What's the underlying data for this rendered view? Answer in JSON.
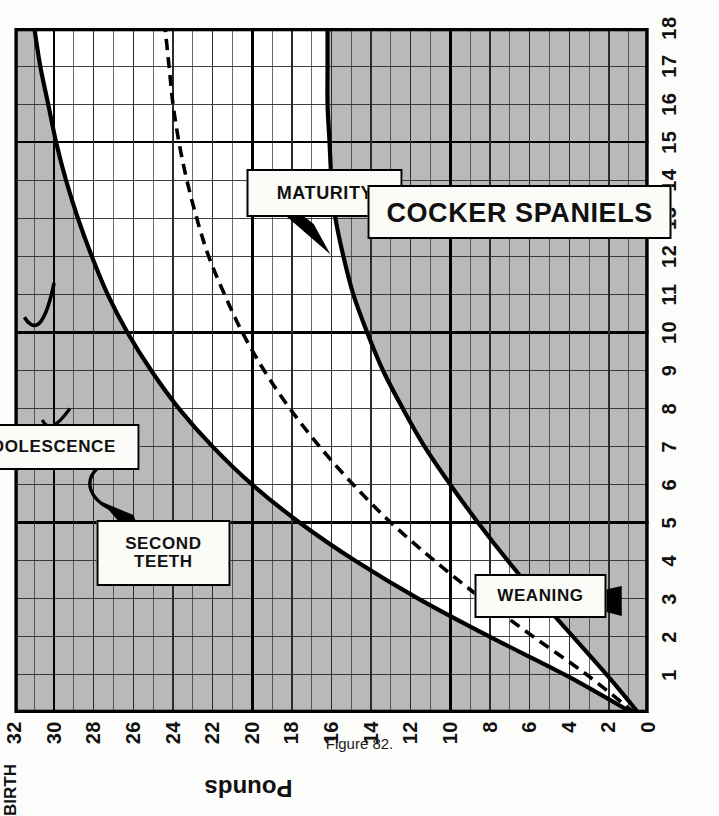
{
  "figure": {
    "caption": "Figure 82."
  },
  "chart_data": {
    "type": "line",
    "title": "COCKER SPANIELS",
    "xlabel": "",
    "ylabel": "Pounds",
    "x_axis_origin_label": "BIRTH",
    "x": [
      0,
      1,
      2,
      3,
      4,
      5,
      6,
      7,
      8,
      9,
      10,
      11,
      12,
      13,
      14,
      15,
      16,
      17,
      18
    ],
    "xtick_labels": [
      "BIRTH",
      "1",
      "2",
      "3",
      "4",
      "5",
      "6",
      "7",
      "8",
      "9",
      "10",
      "11",
      "12",
      "13",
      "14",
      "15",
      "16",
      "17",
      "18"
    ],
    "xlim": [
      0,
      18
    ],
    "ytick_labels": [
      "0",
      "2",
      "4",
      "6",
      "8",
      "10",
      "12",
      "14",
      "16",
      "18",
      "20",
      "22",
      "24",
      "26",
      "28",
      "30",
      "32"
    ],
    "ylim": [
      0,
      32
    ],
    "grid": true,
    "minor_grid_step": 1,
    "major_grid_step": 5,
    "legend_position": "none",
    "series": [
      {
        "name": "upper-limit",
        "style": "solid",
        "values": [
          0.8,
          4.2,
          8.0,
          11.6,
          14.8,
          17.6,
          20.0,
          22.0,
          23.7,
          25.1,
          26.3,
          27.3,
          28.1,
          28.8,
          29.4,
          29.9,
          30.3,
          30.7,
          31.0
        ]
      },
      {
        "name": "average",
        "style": "dashed",
        "values": [
          0.7,
          3.1,
          5.8,
          8.4,
          10.8,
          13.0,
          14.9,
          16.6,
          18.1,
          19.4,
          20.5,
          21.4,
          22.2,
          22.8,
          23.3,
          23.7,
          24.0,
          24.2,
          24.4
        ]
      },
      {
        "name": "lower-limit",
        "style": "solid",
        "values": [
          0.5,
          2.1,
          3.8,
          5.5,
          7.1,
          8.6,
          10.0,
          11.3,
          12.4,
          13.4,
          14.2,
          14.9,
          15.4,
          15.8,
          16.0,
          16.1,
          16.2,
          16.2,
          16.2
        ]
      }
    ],
    "annotations": [
      {
        "id": "weaning",
        "label": "WEANING",
        "lines": [
          "WEANING"
        ],
        "x": 3.0,
        "y": 5.5,
        "arrow": "down-left"
      },
      {
        "id": "second-teeth",
        "label": "SECOND TEETH",
        "lines": [
          "SECOND",
          "TEETH"
        ],
        "x": 4.2,
        "y": 24.5,
        "arrow": "up-right"
      },
      {
        "id": "adolescence",
        "label": "ADOLESCENCE",
        "lines": [
          "ADOLESCENCE"
        ],
        "x": 7.0,
        "y": 30.5,
        "arrow": "brace"
      },
      {
        "id": "maturity",
        "label": "MATURITY",
        "lines": [
          "MATURITY"
        ],
        "x": 13.5,
        "y": 16.5,
        "arrow": "up-left"
      },
      {
        "id": "title-box",
        "label": "COCKER SPANIELS",
        "lines": [
          "COCKER SPANIELS"
        ],
        "x": 13.0,
        "y": 6.5,
        "arrow": "none"
      }
    ],
    "colors": {
      "shade": "#b9b9b9",
      "band": "#ffffff",
      "line": "#000000",
      "grid_minor": "#2b2b2b",
      "grid_major": "#000000"
    }
  }
}
